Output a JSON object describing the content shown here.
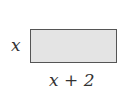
{
  "diagram": {
    "shape": "rectangle",
    "fill_color": "#e4e4e4",
    "stroke_color": "#555555",
    "side_label": "x",
    "bottom_label": "x + 2"
  }
}
